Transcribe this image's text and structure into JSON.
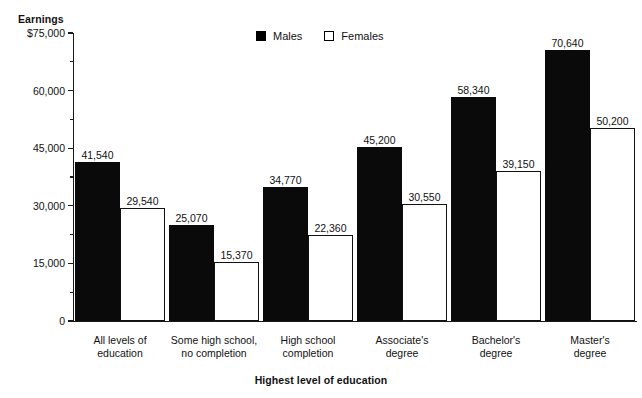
{
  "chart_data": {
    "type": "bar",
    "title": "",
    "xlabel": "Highest level of education",
    "ylabel": "Earnings",
    "categories": [
      "All levels of education",
      "Some high school, no completion",
      "High school completion",
      "Associate's degree",
      "Bachelor's degree",
      "Master's degree"
    ],
    "series": [
      {
        "name": "Males",
        "values": [
          41540,
          25070,
          34770,
          45200,
          58340,
          70640
        ]
      },
      {
        "name": "Females",
        "values": [
          29540,
          15370,
          22360,
          30550,
          39150,
          50200
        ]
      }
    ],
    "ylim": [
      0,
      75000
    ],
    "yticks": [
      0,
      15000,
      30000,
      45000,
      60000,
      75000
    ],
    "ytick_labels": [
      "0",
      "15,000",
      "30,000",
      "45,000",
      "60,000",
      "$75,000"
    ],
    "grid": false,
    "legend_position": "top-center",
    "colors": {
      "males": "#000000",
      "females": "#ffffff",
      "axis": "#1a1a1a"
    }
  },
  "axis": {
    "y_title": "Earnings",
    "x_title": "Highest level of education"
  },
  "legend": {
    "entries": [
      {
        "label": "Males",
        "swatch": "filled-square"
      },
      {
        "label": "Females",
        "swatch": "hollow-square"
      }
    ]
  },
  "categories_display": [
    {
      "line1": "All levels of",
      "line2": "education"
    },
    {
      "line1": "Some high school,",
      "line2": "no completion"
    },
    {
      "line1": "High school",
      "line2": "completion"
    },
    {
      "line1": "Associate's",
      "line2": "degree"
    },
    {
      "line1": "Bachelor's",
      "line2": "degree"
    },
    {
      "line1": "Master's",
      "line2": "degree"
    }
  ],
  "bar_labels": {
    "males": [
      "41,540",
      "25,070",
      "34,770",
      "45,200",
      "58,340",
      "70,640"
    ],
    "females": [
      "29,540",
      "15,370",
      "22,360",
      "30,550",
      "39,150",
      "50,200"
    ]
  },
  "ytick_labels": [
    "$75,000",
    "60,000",
    "45,000",
    "30,000",
    "15,000",
    "0"
  ]
}
